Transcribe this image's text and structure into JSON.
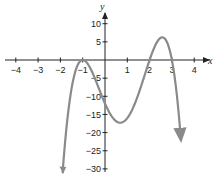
{
  "chart_data": {
    "type": "line",
    "title": "",
    "xlabel": "x",
    "ylabel": "y",
    "xlim": [
      -4,
      4
    ],
    "ylim": [
      -30,
      10
    ],
    "grid": false,
    "x_ticks": [
      -4,
      -3,
      -2,
      -1,
      1,
      2,
      3,
      4
    ],
    "x_tick_labels": [
      "−4",
      "−3",
      "−2",
      "−1",
      "1",
      "2",
      "3",
      "4"
    ],
    "y_ticks": [
      10,
      5,
      -5,
      -10,
      -15,
      -20,
      -25,
      -30
    ],
    "y_tick_labels": [
      "10",
      "5",
      "−5",
      "−10",
      "−15",
      "−20",
      "−25",
      "−30"
    ],
    "series": [
      {
        "name": "f(x) = -2(x+1)^2(x-2)(x-3)",
        "color": "#8a8a8a",
        "end_arrows": true,
        "x": [
          -1.9,
          -1.5,
          -1.0,
          -0.5,
          0.0,
          0.5,
          1.0,
          1.5,
          2.0,
          2.5,
          3.0,
          3.4
        ],
        "y": [
          -29.5,
          -4.4,
          0.0,
          -4.4,
          -12.0,
          -16.9,
          -16.0,
          -9.4,
          0.0,
          6.1,
          0.0,
          -26.3
        ]
      }
    ],
    "key_points": {
      "x_intercepts": [
        -1,
        2,
        3
      ],
      "local_max": [
        {
          "x": -1,
          "y": 0
        },
        {
          "x": 2.5,
          "y": 6.1
        }
      ],
      "local_min": [
        {
          "x": 0.5,
          "y": -16.9
        }
      ],
      "y_intercept": -12
    }
  }
}
